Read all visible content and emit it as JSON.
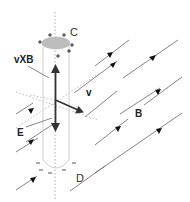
{
  "diagram": {
    "type": "physics-vector-diagram",
    "labels": {
      "force": "vXB",
      "velocity": "v",
      "electric_field": "E",
      "magnetic_field": "B",
      "top_end": "C",
      "bottom_end": "D"
    },
    "charges": {
      "top_sign": "+",
      "bottom_sign": "−"
    },
    "colors": {
      "line": "#555555",
      "arrow": "#333333",
      "rod_outline": "#c8c8c8",
      "rod_cap": "#c0c0c0",
      "dotted": "#aaaaaa"
    }
  }
}
